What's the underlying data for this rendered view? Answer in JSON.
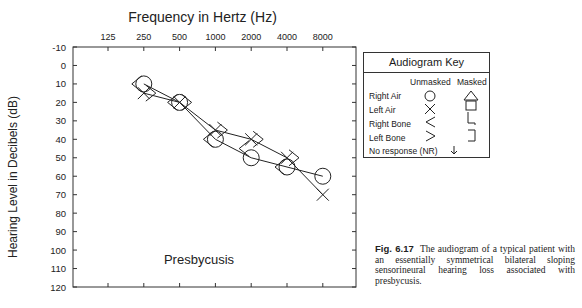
{
  "chart_data": {
    "type": "scatter",
    "title": "Frequency in Hertz (Hz)",
    "xlabel": "Frequency in Hertz (Hz)",
    "ylabel": "Hearing Level in Decibels (dB)",
    "x_ticks": [
      "125",
      "250",
      "500",
      "1000",
      "2000",
      "4000",
      "8000"
    ],
    "y_ticks": [
      "-10",
      "0",
      "10",
      "20",
      "30",
      "40",
      "50",
      "60",
      "70",
      "80",
      "90",
      "100",
      "110",
      "120"
    ],
    "ylim": [
      -10,
      120
    ],
    "y_inverted": true,
    "annotation": "Presbycusis",
    "series": [
      {
        "name": "Right Air",
        "symbol": "circle",
        "connected": true,
        "x": [
          250,
          500,
          1000,
          2000,
          4000,
          8000
        ],
        "values": [
          10,
          20,
          40,
          50,
          55,
          60
        ]
      },
      {
        "name": "Left Air",
        "symbol": "x",
        "connected": true,
        "x": [
          250,
          500,
          1000,
          2000,
          4000,
          8000
        ],
        "values": [
          15,
          20,
          35,
          40,
          50,
          70
        ]
      },
      {
        "name": "Right Bone",
        "symbol": "<",
        "x": [
          250,
          500,
          1000,
          2000,
          4000
        ],
        "values": [
          10,
          20,
          40,
          45,
          55
        ]
      },
      {
        "name": "Left Bone",
        "symbol": ">",
        "x": [
          250,
          500,
          1000,
          2000,
          4000
        ],
        "values": [
          15,
          20,
          35,
          40,
          50
        ]
      }
    ]
  },
  "key": {
    "title": "Audiogram Key",
    "col_unmasked": "Unmasked",
    "col_masked": "Masked",
    "rows": [
      {
        "label": "Right Air"
      },
      {
        "label": "Left Air"
      },
      {
        "label": "Right Bone"
      },
      {
        "label": "Left Bone"
      },
      {
        "label": "No response (NR)"
      }
    ]
  },
  "caption": {
    "fig": "Fig. 6.17",
    "text": "The audiogram of a typical patient with an essentially symmetrical bilateral sloping sensorineural hearing loss associated with presbycusis."
  }
}
